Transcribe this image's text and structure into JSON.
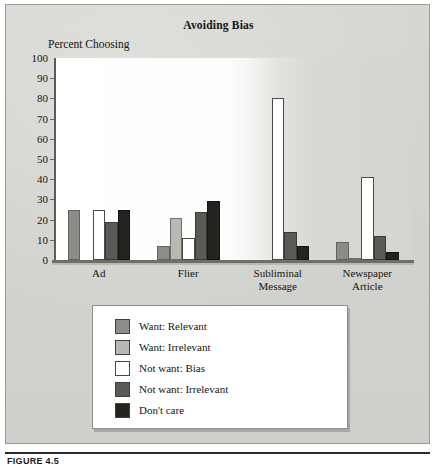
{
  "figure": {
    "caption": "FIGURE 4.5"
  },
  "chart_data": {
    "type": "bar",
    "title": "Avoiding Bias",
    "xlabel": "",
    "ylabel": "Percent Choosing",
    "ylim": [
      0,
      100
    ],
    "yticks": [
      0,
      10,
      20,
      30,
      40,
      50,
      60,
      70,
      80,
      90,
      100
    ],
    "grid": false,
    "legend_position": "below-plot",
    "categories": [
      "Ad",
      "Flier",
      "Subliminal Message",
      "Newspaper Article"
    ],
    "series": [
      {
        "name": "Want: Relevant",
        "color": "#8d8d88",
        "values": [
          25,
          7,
          0,
          9
        ]
      },
      {
        "name": "Want: Irrelevant",
        "color": "#b9b9b4",
        "values": [
          0,
          21,
          0,
          1
        ]
      },
      {
        "name": "Not want: Bias",
        "color": "#ffffff",
        "values": [
          25,
          11,
          80,
          41
        ]
      },
      {
        "name": "Not want: Irrelevant",
        "color": "#5a5a56",
        "values": [
          19,
          24,
          14,
          12
        ]
      },
      {
        "name": "Don't care",
        "color": "#232320",
        "values": [
          25,
          29,
          7,
          4
        ]
      }
    ]
  }
}
